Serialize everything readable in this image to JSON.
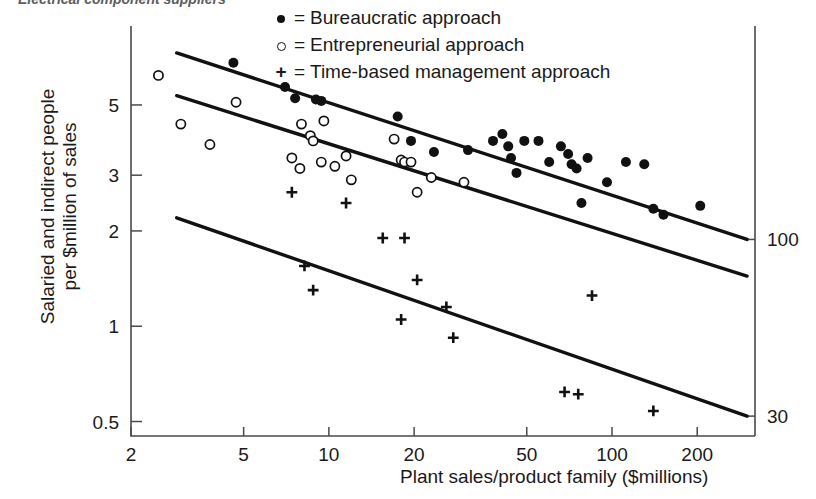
{
  "title": {
    "text": "Electrical component suppliers",
    "clipped": true
  },
  "legend": {
    "position": "top-right",
    "entries": [
      {
        "marker": "filled-circle",
        "glyph": "●",
        "equals": "=",
        "label": "Bureaucratic approach"
      },
      {
        "marker": "open-circle",
        "glyph": "○",
        "equals": "=",
        "label": "Entrepreneurial approach"
      },
      {
        "marker": "plus",
        "glyph": "+",
        "equals": "=",
        "label": "Time-based management approach"
      }
    ]
  },
  "axes": {
    "y_left": {
      "label_line1": "Salaried and indirect people",
      "label_line2": "per $million of sales",
      "ticks": [
        "5",
        "3",
        "2",
        "1",
        "0.5"
      ],
      "scale": "log"
    },
    "y_right": {
      "ticks": [
        "100",
        "30"
      ],
      "scale": "log"
    },
    "x": {
      "label": "Plant sales/product family ($millions)",
      "ticks": [
        "2",
        "5",
        "10",
        "20",
        "50",
        "100",
        "200"
      ],
      "scale": "log"
    }
  },
  "chart_data": {
    "type": "scatter",
    "title": "Electrical component suppliers",
    "xlabel": "Plant sales/product family ($millions)",
    "ylabel": "Salaried and indirect people per $million of sales",
    "xscale": "log",
    "yscale": "log",
    "xlim": [
      2,
      320
    ],
    "ylim": [
      0.45,
      8.5
    ],
    "xticks": [
      2,
      5,
      10,
      20,
      50,
      100,
      200
    ],
    "yticks": [
      0.5,
      1,
      2,
      3,
      5
    ],
    "y_right_ticks": [
      30,
      100
    ],
    "grid": false,
    "legend_position": "top-right",
    "series": [
      {
        "name": "Bureaucratic approach",
        "marker": "filled-circle",
        "color": "#111111",
        "points": [
          [
            4.6,
            6.8
          ],
          [
            7.0,
            5.7
          ],
          [
            7.6,
            5.25
          ],
          [
            9.0,
            5.2
          ],
          [
            9.4,
            5.15
          ],
          [
            17.5,
            4.6
          ],
          [
            19.5,
            3.85
          ],
          [
            23.5,
            3.55
          ],
          [
            31.0,
            3.6
          ],
          [
            38.0,
            3.85
          ],
          [
            41.0,
            4.05
          ],
          [
            43.0,
            3.7
          ],
          [
            44.0,
            3.4
          ],
          [
            46.0,
            3.05
          ],
          [
            49.0,
            3.85
          ],
          [
            55.0,
            3.85
          ],
          [
            60.0,
            3.3
          ],
          [
            66.0,
            3.7
          ],
          [
            70.0,
            3.5
          ],
          [
            72.0,
            3.25
          ],
          [
            75.0,
            3.15
          ],
          [
            78.0,
            2.45
          ],
          [
            82.0,
            3.4
          ],
          [
            96.0,
            2.85
          ],
          [
            112.0,
            3.3
          ],
          [
            130.0,
            3.25
          ],
          [
            140.0,
            2.35
          ],
          [
            152.0,
            2.25
          ],
          [
            205.0,
            2.4
          ]
        ]
      },
      {
        "name": "Entrepreneurial approach",
        "marker": "open-circle",
        "color": "#111111",
        "points": [
          [
            2.5,
            6.2
          ],
          [
            3.0,
            4.35
          ],
          [
            3.8,
            3.75
          ],
          [
            4.7,
            5.1
          ],
          [
            7.4,
            3.4
          ],
          [
            7.9,
            3.15
          ],
          [
            8.0,
            4.35
          ],
          [
            8.6,
            4.0
          ],
          [
            8.8,
            3.85
          ],
          [
            9.4,
            3.3
          ],
          [
            9.6,
            4.45
          ],
          [
            10.5,
            3.2
          ],
          [
            11.5,
            3.45
          ],
          [
            12.0,
            2.9
          ],
          [
            17.0,
            3.9
          ],
          [
            18.0,
            3.35
          ],
          [
            18.5,
            3.3
          ],
          [
            19.5,
            3.3
          ],
          [
            20.5,
            2.65
          ],
          [
            23.0,
            2.95
          ],
          [
            30.0,
            2.85
          ]
        ]
      },
      {
        "name": "Time-based management approach",
        "marker": "plus",
        "color": "#111111",
        "points": [
          [
            7.4,
            2.65
          ],
          [
            8.2,
            1.55
          ],
          [
            8.8,
            1.3
          ],
          [
            11.5,
            2.45
          ],
          [
            15.5,
            1.9
          ],
          [
            18.5,
            1.9
          ],
          [
            18.0,
            1.05
          ],
          [
            20.5,
            1.4
          ],
          [
            26.0,
            1.15
          ],
          [
            27.5,
            0.92
          ],
          [
            68.0,
            0.62
          ],
          [
            76.0,
            0.61
          ],
          [
            85.0,
            1.25
          ],
          [
            140.0,
            0.54
          ]
        ]
      }
    ],
    "trend_lines": [
      {
        "name": "bureaucratic-trend",
        "x0": 2.9,
        "y0": 7.3,
        "x1": 300,
        "y1": 1.88
      },
      {
        "name": "entrepreneurial-trend",
        "x0": 2.9,
        "y0": 5.35,
        "x1": 300,
        "y1": 1.44
      },
      {
        "name": "time-based-trend",
        "x0": 2.9,
        "y0": 2.2,
        "x1": 300,
        "y1": 0.52
      }
    ]
  }
}
